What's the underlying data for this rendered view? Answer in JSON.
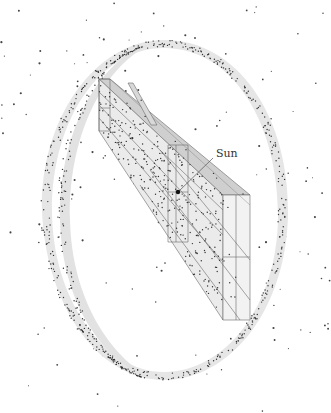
{
  "diagram": {
    "type": "3d-schematic",
    "labels": {
      "sun": "Sun"
    },
    "colors": {
      "background": "#ffffff",
      "ring_fill": "#e4e4e4",
      "box_fill_light": "#ececec",
      "box_fill_dark": "#cfcfcf",
      "stroke": "#555555",
      "dots": "#333333"
    },
    "geometry": {
      "outer_ellipse": {
        "cx": 164,
        "cy": 210,
        "rx": 123,
        "ry": 170
      },
      "sun_point": {
        "x": 178,
        "y": 192
      },
      "sun_label_pos": {
        "x": 218,
        "y": 148
      }
    }
  }
}
